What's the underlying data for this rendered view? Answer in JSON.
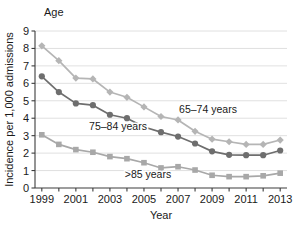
{
  "chart_data": {
    "type": "line",
    "title": "Age",
    "xlabel": "Year",
    "ylabel": "Incidence per 1,000 admissions",
    "x": [
      1999,
      2000,
      2001,
      2002,
      2003,
      2004,
      2005,
      2006,
      2007,
      2008,
      2009,
      2010,
      2011,
      2012,
      2013
    ],
    "xlim": [
      1998.6,
      2013.4
    ],
    "ylim": [
      0,
      9
    ],
    "xticks": [
      1999,
      2000,
      2001,
      2002,
      2003,
      2004,
      2005,
      2006,
      2007,
      2008,
      2009,
      2010,
      2011,
      2012,
      2013
    ],
    "xticklabels": [
      "1999",
      "",
      "2001",
      "",
      "2003",
      "",
      "2005",
      "",
      "2007",
      "",
      "2009",
      "",
      "2011",
      "",
      "2013"
    ],
    "yticks": [
      0,
      1,
      2,
      3,
      4,
      5,
      6,
      7,
      8,
      9
    ],
    "yticklabels": [
      "0",
      "1",
      "2",
      "3",
      "4",
      "5",
      "6",
      "7",
      "8",
      "9"
    ],
    "grid": "horizontal",
    "legend_position": "inline-annotations",
    "series": [
      {
        "name": "65–74 years",
        "label": "65–74 years",
        "color": "#b5b5b5",
        "marker": "diamond",
        "values": [
          8.15,
          7.3,
          6.3,
          6.25,
          5.5,
          5.2,
          4.65,
          4.1,
          3.9,
          3.25,
          2.8,
          2.65,
          2.5,
          2.5,
          2.75
        ],
        "annotation": {
          "text": "65–74 years",
          "x_px": 208,
          "y_px": 113
        }
      },
      {
        "name": "75–84 years",
        "label": "75–84 years",
        "color": "#6e6e6e",
        "marker": "circle",
        "values": [
          6.4,
          5.5,
          4.85,
          4.75,
          4.2,
          4.0,
          3.5,
          3.2,
          2.95,
          2.55,
          2.1,
          1.9,
          1.88,
          1.88,
          2.15
        ],
        "annotation": {
          "text": "75–84 years",
          "x_px": 118,
          "y_px": 130
        }
      },
      {
        "name": ">85 years",
        "label": ">85 years",
        "color": "#a8a8a8",
        "marker": "square",
        "values": [
          3.05,
          2.5,
          2.2,
          2.05,
          1.8,
          1.68,
          1.45,
          1.15,
          1.22,
          1.03,
          0.73,
          0.65,
          0.65,
          0.7,
          0.85
        ],
        "annotation": {
          "text": ">85 years",
          "x_px": 148,
          "y_px": 178
        }
      }
    ]
  },
  "colors": {
    "axis": "#3c3c3c",
    "grid": "#d8d8d8",
    "text": "#1a1a1a",
    "background": "#ffffff",
    "series_65_74": "#b5b5b5",
    "series_75_84": "#6e6e6e",
    "series_85_plus": "#a8a8a8"
  },
  "geometry": {
    "plot_left": 35,
    "plot_right": 287,
    "plot_top": 31,
    "plot_bottom": 188
  }
}
